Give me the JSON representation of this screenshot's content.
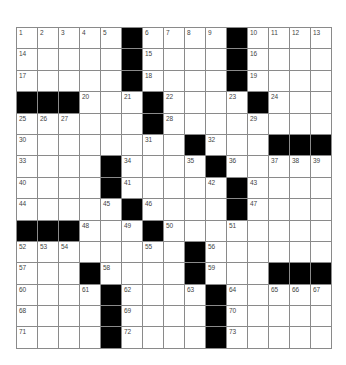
{
  "puzzle": {
    "rows": 15,
    "cols": 15,
    "colors": {
      "grid_line": "#8a8a8a",
      "block": "#000000",
      "cell": "#ffffff",
      "number": "#444444"
    },
    "grid": [
      [
        "1",
        "2",
        "3",
        "4",
        "5",
        "#",
        "6",
        "7",
        "8",
        "9",
        "#",
        "10",
        "11",
        "12",
        "13"
      ],
      [
        "14",
        "",
        "",
        "",
        "",
        "#",
        "15",
        "",
        "",
        "",
        "#",
        "16",
        "",
        "",
        ""
      ],
      [
        "17",
        "",
        "",
        "",
        "",
        "#",
        "18",
        "",
        "",
        "",
        "#",
        "19",
        "",
        "",
        ""
      ],
      [
        "#",
        "#",
        "#",
        "20",
        "",
        "21",
        "#",
        "22",
        "",
        "",
        "23",
        "#",
        "24",
        "",
        ""
      ],
      [
        "25",
        "26",
        "27",
        "",
        "",
        "",
        "#",
        "28",
        "",
        "",
        "",
        "29",
        "",
        "",
        ""
      ],
      [
        "30",
        "",
        "",
        "",
        "",
        "",
        "31",
        "",
        "#",
        "32",
        "",
        "",
        "#",
        "#",
        "#"
      ],
      [
        "33",
        "",
        "",
        "",
        "#",
        "34",
        "",
        "",
        "35",
        "#",
        "36",
        "",
        "37",
        "38",
        "39"
      ],
      [
        "40",
        "",
        "",
        "",
        "#",
        "41",
        "",
        "",
        "",
        "42",
        "#",
        "43",
        "",
        "",
        ""
      ],
      [
        "44",
        "",
        "",
        "",
        "45",
        "#",
        "46",
        "",
        "",
        "",
        "#",
        "47",
        "",
        "",
        ""
      ],
      [
        "#",
        "#",
        "#",
        "48",
        "",
        "49",
        "#",
        "50",
        "",
        "",
        "51",
        "",
        "",
        "",
        ""
      ],
      [
        "52",
        "53",
        "54",
        "",
        "",
        "",
        "55",
        "",
        "#",
        "56",
        "",
        "",
        "",
        "",
        ""
      ],
      [
        "57",
        "",
        "",
        "#",
        "58",
        "",
        "",
        "",
        "#",
        "59",
        "",
        "",
        "#",
        "#",
        "#"
      ],
      [
        "60",
        "",
        "",
        "61",
        "#",
        "62",
        "",
        "",
        "63",
        "#",
        "64",
        "",
        "65",
        "66",
        "67"
      ],
      [
        "68",
        "",
        "",
        "",
        "#",
        "69",
        "",
        "",
        "",
        "#",
        "70",
        "",
        "",
        "",
        ""
      ],
      [
        "71",
        "",
        "",
        "",
        "#",
        "72",
        "",
        "",
        "",
        "#",
        "73",
        "",
        "",
        "",
        ""
      ]
    ]
  }
}
